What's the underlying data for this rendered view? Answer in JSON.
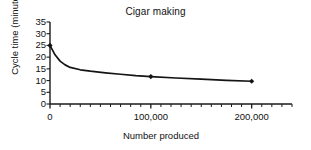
{
  "chart_data": {
    "type": "line",
    "title": "Cigar making",
    "xlabel": "Number produced",
    "ylabel": "Cycle time (minutes)",
    "xlim": [
      0,
      240000
    ],
    "ylim": [
      0,
      35
    ],
    "grid": false,
    "legend": null,
    "y_ticks": [
      0,
      5,
      10,
      15,
      20,
      25,
      30,
      35
    ],
    "y_tick_labels": [
      "0",
      "5",
      "10",
      "15",
      "20",
      "25",
      "30",
      "35"
    ],
    "x_ticks_major": [
      0,
      100000,
      200000
    ],
    "x_tick_labels": [
      "0",
      "100,000",
      "200,000"
    ],
    "x_minor_tick_interval": 10000,
    "series": [
      {
        "name": "Cycle time",
        "marker": "diamond",
        "markers_at": [
          {
            "x": 0,
            "y": 25.0
          },
          {
            "x": 100000,
            "y": 11.7
          },
          {
            "x": 200000,
            "y": 9.7
          }
        ],
        "x": [
          0,
          5000,
          10000,
          15000,
          20000,
          30000,
          40000,
          55000,
          70000,
          85000,
          100000,
          125000,
          150000,
          175000,
          200000
        ],
        "values": [
          25.0,
          21.0,
          18.3,
          16.7,
          15.6,
          14.6,
          14.0,
          13.3,
          12.7,
          12.1,
          11.7,
          11.1,
          10.6,
          10.1,
          9.7
        ]
      }
    ]
  }
}
